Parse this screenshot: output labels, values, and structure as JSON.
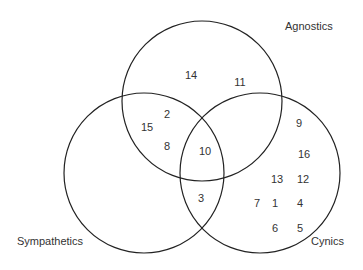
{
  "diagram": {
    "type": "venn",
    "sets": [
      {
        "name": "Agnostics",
        "cx": 202,
        "cy": 101,
        "r": 80,
        "label_x": 285,
        "label_y": 27
      },
      {
        "name": "Sympathetics",
        "cx": 144,
        "cy": 173,
        "r": 80,
        "label_x": 17,
        "label_y": 242
      },
      {
        "name": "Cynics",
        "cx": 260,
        "cy": 173,
        "r": 80,
        "label_x": 311,
        "label_y": 242
      }
    ],
    "stroke_color": "#222222",
    "numbers": [
      {
        "value": "14",
        "x": 191,
        "y": 75,
        "region": "Agnostics only"
      },
      {
        "value": "11",
        "x": 240,
        "y": 82,
        "region": "Agnostics only"
      },
      {
        "value": "2",
        "x": 167,
        "y": 114,
        "region": "Agnostics ∩ Sympathetics"
      },
      {
        "value": "15",
        "x": 147,
        "y": 127,
        "region": "Agnostics ∩ Sympathetics"
      },
      {
        "value": "8",
        "x": 167,
        "y": 146,
        "region": "Agnostics ∩ Sympathetics"
      },
      {
        "value": "10",
        "x": 205,
        "y": 151,
        "region": "All three"
      },
      {
        "value": "3",
        "x": 201,
        "y": 198,
        "region": "Sympathetics ∩ Cynics"
      },
      {
        "value": "9",
        "x": 299,
        "y": 123,
        "region": "Cynics only"
      },
      {
        "value": "16",
        "x": 304,
        "y": 154,
        "region": "Cynics only"
      },
      {
        "value": "13",
        "x": 277,
        "y": 179,
        "region": "Cynics only"
      },
      {
        "value": "12",
        "x": 303,
        "y": 179,
        "region": "Cynics only"
      },
      {
        "value": "7",
        "x": 257,
        "y": 203,
        "region": "Cynics only"
      },
      {
        "value": "1",
        "x": 275,
        "y": 203,
        "region": "Cynics only"
      },
      {
        "value": "4",
        "x": 300,
        "y": 203,
        "region": "Cynics only"
      },
      {
        "value": "6",
        "x": 275,
        "y": 228,
        "region": "Cynics only"
      },
      {
        "value": "5",
        "x": 300,
        "y": 228,
        "region": "Cynics only"
      }
    ]
  }
}
